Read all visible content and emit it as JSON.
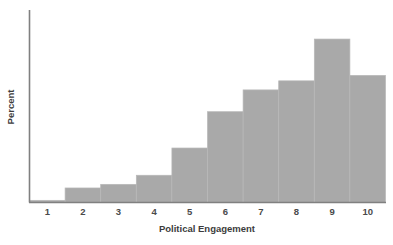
{
  "chart_data": {
    "type": "bar",
    "title": "",
    "subtitle": "",
    "xlabel": "Political Engagement",
    "ylabel": "Percent",
    "categories": [
      "1",
      "2",
      "3",
      "4",
      "5",
      "6",
      "7",
      "8",
      "9",
      "10"
    ],
    "values": [
      0.6,
      4.0,
      5.0,
      7.5,
      15.0,
      25.0,
      31.0,
      33.5,
      45.0,
      35.0
    ],
    "ylim": [
      0,
      53
    ],
    "xlim": [
      0.5,
      10.5
    ],
    "grid": false,
    "legend": null,
    "bar_color": "#a9a9a9",
    "axis_color": "#808080",
    "background": "#ffffff",
    "annotations": []
  },
  "axes": {
    "y_axis_name": "y-axis",
    "x_axis_name": "x-axis"
  }
}
